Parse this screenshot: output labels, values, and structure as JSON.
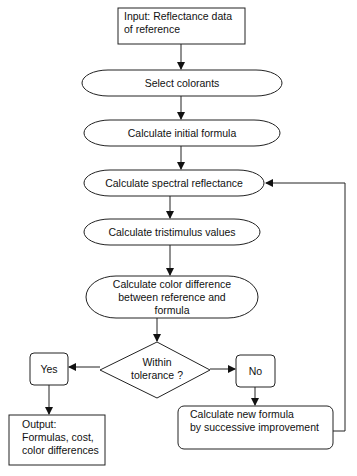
{
  "diagram": {
    "type": "flowchart",
    "nodes": {
      "input": {
        "line1": "Input: Reflectance data",
        "line2": "of reference"
      },
      "select_colorants": {
        "label": "Select colorants"
      },
      "initial_formula": {
        "label": "Calculate initial formula"
      },
      "spectral_reflectance": {
        "label": "Calculate spectral reflectance"
      },
      "tristimulus": {
        "label": "Calculate tristimulus values"
      },
      "color_difference": {
        "line1": "Calculate color difference",
        "line2": "between reference and",
        "line3": "formula"
      },
      "decision": {
        "line1": "Within",
        "line2": "tolerance ?"
      },
      "yes": {
        "label": "Yes"
      },
      "no": {
        "label": "No"
      },
      "output": {
        "line1": "Output:",
        "line2": "Formulas, cost,",
        "line3": "color differences"
      },
      "new_formula": {
        "line1": "Calculate new formula",
        "line2": "by successive improvement"
      }
    },
    "edges": [
      [
        "input",
        "select_colorants"
      ],
      [
        "select_colorants",
        "initial_formula"
      ],
      [
        "initial_formula",
        "spectral_reflectance"
      ],
      [
        "spectral_reflectance",
        "tristimulus"
      ],
      [
        "tristimulus",
        "color_difference"
      ],
      [
        "color_difference",
        "decision"
      ],
      [
        "decision",
        "yes"
      ],
      [
        "decision",
        "no"
      ],
      [
        "yes",
        "output"
      ],
      [
        "no",
        "new_formula"
      ],
      [
        "new_formula",
        "spectral_reflectance"
      ]
    ],
    "colors": {
      "stroke": "#222222",
      "background": "#ffffff"
    }
  }
}
